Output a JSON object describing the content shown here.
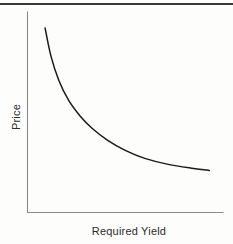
{
  "figure": {
    "background_color": "#fdfdfc",
    "top_rule_color": "#3a3a3a",
    "axis_color": "#8a8a8a",
    "curve_color": "#1a1a1a"
  },
  "chart_data": {
    "type": "line",
    "title": "",
    "subtitle": "",
    "xlabel": "Required Yield",
    "ylabel": "Price",
    "legend": [],
    "legend_position": "none",
    "grid": false,
    "axis_ticks": false,
    "tick_labels": {
      "x": [],
      "y": []
    },
    "xlim": [
      0,
      100
    ],
    "ylim": [
      0,
      100
    ],
    "annotations": [],
    "series": [
      {
        "name": "Price vs Required Yield",
        "color": "#1a1a1a",
        "x": [
          9,
          12,
          16,
          21,
          27,
          33,
          41,
          50,
          60,
          72,
          85,
          93
        ],
        "y": [
          92,
          78,
          66,
          56,
          48,
          42,
          36,
          31,
          27,
          24,
          22,
          21
        ]
      }
    ]
  }
}
